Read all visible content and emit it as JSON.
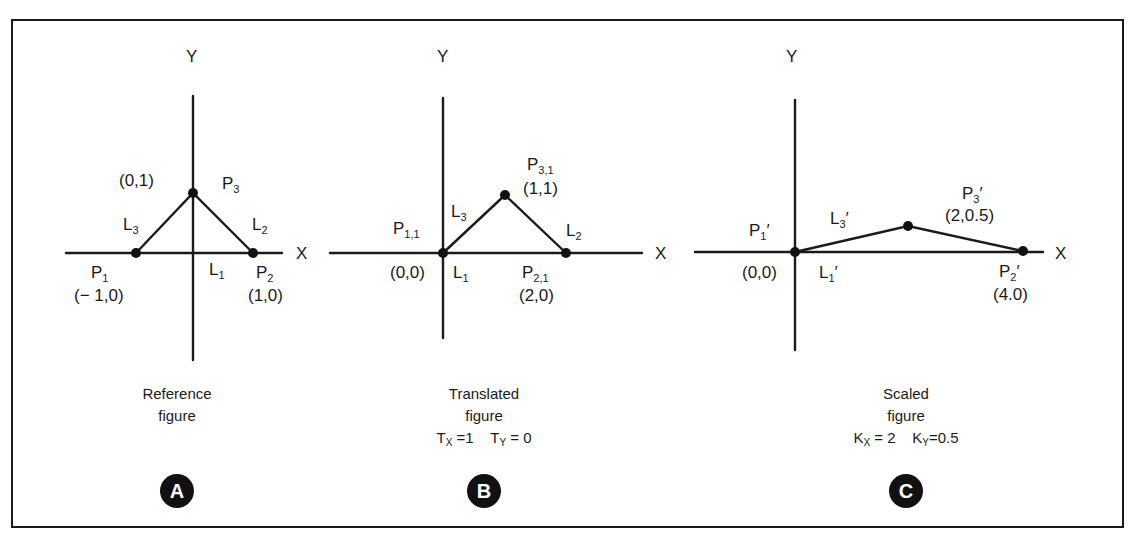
{
  "figure": {
    "panels": [
      {
        "id": "A",
        "badge": "A",
        "caption_line1": "Reference",
        "caption_line2": "figure",
        "params": null,
        "axes": {
          "x_label": "X",
          "y_label": "Y"
        },
        "points": [
          {
            "name": "P",
            "sub": "1",
            "prime": "",
            "coord": "(− 1,0)",
            "x": -1,
            "y": 0
          },
          {
            "name": "P",
            "sub": "2",
            "prime": "",
            "coord": "(1,0)",
            "x": 1,
            "y": 0
          },
          {
            "name": "P",
            "sub": "3",
            "prime": "",
            "coord": "(0,1)",
            "x": 0,
            "y": 1
          }
        ],
        "lines": [
          {
            "name": "L",
            "sub": "1",
            "prime": ""
          },
          {
            "name": "L",
            "sub": "2",
            "prime": ""
          },
          {
            "name": "L",
            "sub": "3",
            "prime": ""
          }
        ]
      },
      {
        "id": "B",
        "badge": "B",
        "caption_line1": "Translated",
        "caption_line2": "figure",
        "params": {
          "p1_name": "T",
          "p1_sub": "X",
          "p1_val": " =1",
          "p2_name": "T",
          "p2_sub": "Y",
          "p2_val": " = 0"
        },
        "axes": {
          "x_label": "X",
          "y_label": "Y"
        },
        "points": [
          {
            "name": "P",
            "sub": "1,1",
            "prime": "",
            "coord": "(0,0)",
            "x": 0,
            "y": 0
          },
          {
            "name": "P",
            "sub": "2,1",
            "prime": "",
            "coord": "(2,0)",
            "x": 2,
            "y": 0
          },
          {
            "name": "P",
            "sub": "3,1",
            "prime": "",
            "coord": "(1,1)",
            "x": 1,
            "y": 1
          }
        ],
        "lines": [
          {
            "name": "L",
            "sub": "1",
            "prime": ""
          },
          {
            "name": "L",
            "sub": "2",
            "prime": ""
          },
          {
            "name": "L",
            "sub": "3",
            "prime": ""
          }
        ]
      },
      {
        "id": "C",
        "badge": "C",
        "caption_line1": "Scaled",
        "caption_line2": "figure",
        "params": {
          "p1_name": "K",
          "p1_sub": "X",
          "p1_val": " = 2",
          "p2_name": "K",
          "p2_sub": "Y",
          "p2_val": "=0.5"
        },
        "axes": {
          "x_label": "X",
          "y_label": "Y"
        },
        "points": [
          {
            "name": "P",
            "sub": "1",
            "prime": "′",
            "coord": "(0,0)",
            "x": 0,
            "y": 0
          },
          {
            "name": "P",
            "sub": "2",
            "prime": "′",
            "coord": "(4.0)",
            "x": 4,
            "y": 0
          },
          {
            "name": "P",
            "sub": "3",
            "prime": "′",
            "coord": "(2,0.5)",
            "x": 2,
            "y": 0.5
          }
        ],
        "lines": [
          {
            "name": "L",
            "sub": "1",
            "prime": "′"
          },
          {
            "name": "L",
            "sub": "3",
            "prime": "′"
          }
        ]
      }
    ]
  }
}
